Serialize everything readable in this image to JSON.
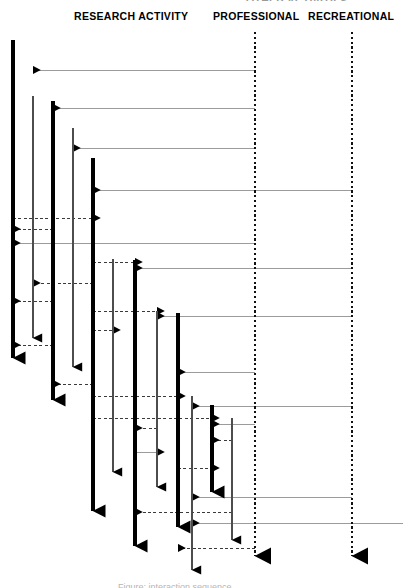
{
  "figure": {
    "type": "sequence-diagram",
    "width": 403,
    "height": 588,
    "background": "#ffffff",
    "clipped_top_text": "OTHER ACTIVITIES",
    "clipped_bottom_caption": "Figure: interaction sequence"
  },
  "headers": {
    "research": "RESEARCH ACTIVITY",
    "professional": "PROFESSIONAL",
    "recreational": "RECREATIONAL"
  },
  "colors": {
    "thick_lifeline": "#000000",
    "thin_lifeline": "#4d4d4d",
    "dotted_lifeline": "#111111",
    "solid_message": "#9b9b9b",
    "dashed_message": "#3a3a3a",
    "arrowhead": "#000000"
  },
  "legend": {
    "solid_line_meaning": "incoming message",
    "dashed_line_meaning": "return message",
    "dotted_line_meaning": "external actor lifeline"
  },
  "lifelines": [
    {
      "id": "L1",
      "x": 13,
      "y_top": 40,
      "y_bottom": 358,
      "weight": "thick",
      "terminator": "arrow"
    },
    {
      "id": "L2",
      "x": 33,
      "y_top": 96,
      "y_bottom": 338,
      "weight": "thin",
      "terminator": "arrow"
    },
    {
      "id": "L3",
      "x": 53,
      "y_top": 101,
      "y_bottom": 400,
      "weight": "thick",
      "terminator": "arrow"
    },
    {
      "id": "L4",
      "x": 73,
      "y_top": 128,
      "y_bottom": 367,
      "weight": "thin",
      "terminator": "arrow"
    },
    {
      "id": "L5",
      "x": 93,
      "y_top": 158,
      "y_bottom": 511,
      "weight": "thick",
      "terminator": "arrow"
    },
    {
      "id": "L6",
      "x": 113,
      "y_top": 259,
      "y_bottom": 472,
      "weight": "thin",
      "terminator": "arrow"
    },
    {
      "id": "L7",
      "x": 135,
      "y_top": 260,
      "y_bottom": 546,
      "weight": "thick",
      "terminator": "arrow"
    },
    {
      "id": "L8",
      "x": 157,
      "y_top": 311,
      "y_bottom": 487,
      "weight": "thin",
      "terminator": "arrow"
    },
    {
      "id": "L9",
      "x": 178,
      "y_top": 313,
      "y_bottom": 527,
      "weight": "thick",
      "terminator": "arrow"
    },
    {
      "id": "L10",
      "x": 192,
      "y_top": 396,
      "y_bottom": 570,
      "weight": "thin",
      "terminator": "arrow"
    },
    {
      "id": "L11",
      "x": 212,
      "y_top": 405,
      "y_bottom": 492,
      "weight": "thick",
      "terminator": "arrow"
    },
    {
      "id": "L12",
      "x": 232,
      "y_top": 418,
      "y_bottom": 540,
      "weight": "thin",
      "terminator": "arrow"
    },
    {
      "id": "PROFESSIONAL",
      "x": 255,
      "y_top": 32,
      "y_bottom": 556,
      "weight": "dotted",
      "terminator": "big-arrow"
    },
    {
      "id": "RECREATIONAL",
      "x": 352,
      "y_top": 32,
      "y_bottom": 556,
      "weight": "dotted",
      "terminator": "big-arrow"
    }
  ],
  "messages": [
    {
      "y": 70,
      "x1": 255,
      "x2": 33,
      "style": "solid",
      "dir": "left"
    },
    {
      "y": 108,
      "x1": 255,
      "x2": 53,
      "style": "solid",
      "dir": "left"
    },
    {
      "y": 148,
      "x1": 255,
      "x2": 73,
      "style": "solid",
      "dir": "left"
    },
    {
      "y": 190,
      "x1": 352,
      "x2": 93,
      "style": "solid",
      "dir": "left"
    },
    {
      "y": 218,
      "x1": 13,
      "x2": 93,
      "style": "dashed",
      "dir": "right"
    },
    {
      "y": 243,
      "x1": 255,
      "x2": 13,
      "style": "solid",
      "dir": "left"
    },
    {
      "y": 229,
      "x1": 53,
      "x2": 13,
      "style": "dashed",
      "dir": "left"
    },
    {
      "y": 262,
      "x1": 93,
      "x2": 135,
      "style": "dashed",
      "dir": "right"
    },
    {
      "y": 268,
      "x1": 352,
      "x2": 135,
      "style": "solid",
      "dir": "left"
    },
    {
      "y": 283,
      "x1": 93,
      "x2": 33,
      "style": "dashed",
      "dir": "left"
    },
    {
      "y": 301,
      "x1": 53,
      "x2": 13,
      "style": "dashed",
      "dir": "left"
    },
    {
      "y": 311,
      "x1": 93,
      "x2": 157,
      "style": "dashed",
      "dir": "right"
    },
    {
      "y": 316,
      "x1": 352,
      "x2": 157,
      "style": "solid",
      "dir": "left"
    },
    {
      "y": 330,
      "x1": 93,
      "x2": 113,
      "style": "dashed",
      "dir": "right"
    },
    {
      "y": 345,
      "x1": 53,
      "x2": 13,
      "style": "dashed",
      "dir": "left"
    },
    {
      "y": 372,
      "x1": 255,
      "x2": 178,
      "style": "solid",
      "dir": "left"
    },
    {
      "y": 384,
      "x1": 93,
      "x2": 53,
      "style": "dashed",
      "dir": "left"
    },
    {
      "y": 396,
      "x1": 93,
      "x2": 178,
      "style": "dashed",
      "dir": "right"
    },
    {
      "y": 406,
      "x1": 352,
      "x2": 192,
      "style": "solid",
      "dir": "left"
    },
    {
      "y": 418,
      "x1": 93,
      "x2": 212,
      "style": "dashed",
      "dir": "right"
    },
    {
      "y": 424,
      "x1": 255,
      "x2": 212,
      "style": "solid",
      "dir": "left"
    },
    {
      "y": 428,
      "x1": 157,
      "x2": 135,
      "style": "dashed",
      "dir": "left"
    },
    {
      "y": 440,
      "x1": 232,
      "x2": 212,
      "style": "dashed",
      "dir": "left"
    },
    {
      "y": 452,
      "x1": 135,
      "x2": 157,
      "style": "solid",
      "dir": "right"
    },
    {
      "y": 468,
      "x1": 178,
      "x2": 212,
      "style": "dashed",
      "dir": "right"
    },
    {
      "y": 497,
      "x1": 352,
      "x2": 192,
      "style": "solid",
      "dir": "left"
    },
    {
      "y": 512,
      "x1": 232,
      "x2": 135,
      "style": "dashed",
      "dir": "left"
    },
    {
      "y": 523,
      "x1": 403,
      "x2": 192,
      "style": "solid",
      "dir": "left"
    },
    {
      "y": 548,
      "x1": 255,
      "x2": 178,
      "style": "dashed",
      "dir": "left"
    }
  ]
}
